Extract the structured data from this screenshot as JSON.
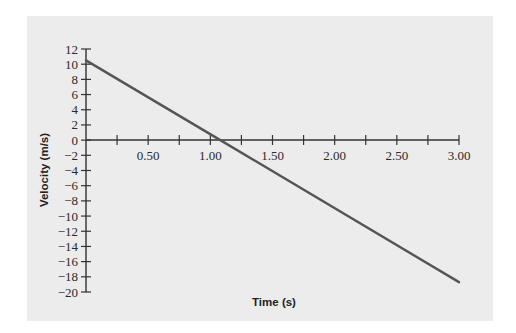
{
  "chart_data": {
    "type": "line",
    "title": "",
    "xlabel": "Time (s)",
    "ylabel": "Velocity (m/s)",
    "xlim": [
      0,
      3.0
    ],
    "ylim": [
      -20,
      12
    ],
    "grid": false,
    "legend": null,
    "x_ticks": [
      0.25,
      0.5,
      0.75,
      1.0,
      1.25,
      1.5,
      1.75,
      2.0,
      2.25,
      2.5,
      2.75,
      3.0
    ],
    "x_tick_labels": [
      "0.50",
      "1.00",
      "1.50",
      "2.00",
      "2.50",
      "3.00"
    ],
    "y_ticks": [
      12,
      10,
      8,
      6,
      4,
      2,
      0,
      -2,
      -4,
      -6,
      -8,
      -10,
      -12,
      -14,
      -16,
      -18,
      -20
    ],
    "y_tick_labels": [
      "12",
      "10",
      "8",
      "6",
      "4",
      "2",
      "0",
      "−2",
      "−4",
      "−6",
      "−8",
      "−10",
      "−12",
      "−14",
      "−16",
      "−18",
      "−20"
    ],
    "series": [
      {
        "name": "velocity",
        "x": [
          0,
          1.08,
          3.0
        ],
        "y": [
          10.5,
          0,
          -18.7
        ]
      }
    ],
    "colors": {
      "line": "#555555",
      "axis": "#333333",
      "background": "#ececec"
    }
  }
}
